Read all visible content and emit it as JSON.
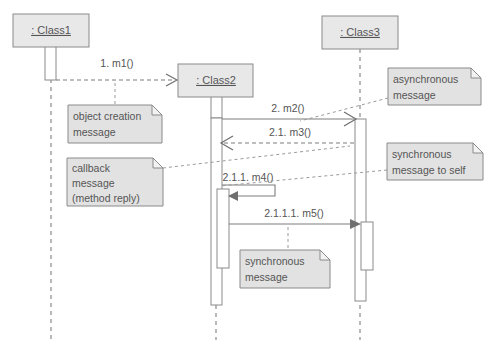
{
  "diagram": {
    "type": "uml-sequence-diagram",
    "colors": {
      "box_fill": "#e8e8e8",
      "note_fill": "#e2e2e2",
      "line": "#8a8a8a",
      "text": "#555555",
      "background": "#ffffff"
    },
    "lifelines": [
      {
        "id": "class1",
        "label": ": Class1",
        "x": 51,
        "box": {
          "x": 13,
          "y": 14,
          "w": 76,
          "h": 33
        }
      },
      {
        "id": "class2",
        "label": ": Class2",
        "x": 216,
        "box": {
          "x": 178,
          "y": 64,
          "w": 75,
          "h": 33
        }
      },
      {
        "id": "class3",
        "label": ": Class3",
        "x": 360,
        "box": {
          "x": 322,
          "y": 16,
          "w": 76,
          "h": 33
        }
      }
    ],
    "messages": [
      {
        "id": "m1",
        "label": "1. m1()",
        "kind": "object-creation",
        "line_style": "dashed",
        "arrow_style": "open",
        "from": "class1",
        "to": "class2",
        "y": 80
      },
      {
        "id": "m2",
        "label": "2. m2()",
        "kind": "asynchronous",
        "line_style": "solid",
        "arrow_style": "open",
        "from": "class2",
        "to": "class3",
        "y": 119
      },
      {
        "id": "m3",
        "label": "2.1. m3()",
        "kind": "callback-reply",
        "line_style": "dashed",
        "arrow_style": "open",
        "from": "class3",
        "to": "class2",
        "y": 143
      },
      {
        "id": "m4",
        "label": "2.1.1. m4()",
        "kind": "synchronous-to-self",
        "line_style": "solid",
        "arrow_style": "filled",
        "from": "class2",
        "to": "class2",
        "y": 186
      },
      {
        "id": "m5",
        "label": "2.1.1.1. m5()",
        "kind": "synchronous",
        "line_style": "solid",
        "arrow_style": "filled",
        "from": "class2",
        "to": "class3",
        "y": 224
      }
    ],
    "notes": [
      {
        "id": "note-object-creation",
        "lines": [
          "object creation",
          "message"
        ],
        "box": {
          "x": 68,
          "y": 105,
          "w": 94,
          "h": 38
        },
        "target_message": "m1"
      },
      {
        "id": "note-callback",
        "lines": [
          "callback",
          "message",
          "(method reply)"
        ],
        "box": {
          "x": 67,
          "y": 158,
          "w": 96,
          "h": 48
        },
        "target_message": "m3"
      },
      {
        "id": "note-asynchronous",
        "lines": [
          "asynchronous",
          "message"
        ],
        "box": {
          "x": 388,
          "y": 68,
          "w": 93,
          "h": 37
        },
        "target_message": "m2"
      },
      {
        "id": "note-synchronous-self",
        "lines": [
          "synchronous",
          "message to self"
        ],
        "box": {
          "x": 387,
          "y": 143,
          "w": 96,
          "h": 37
        },
        "target_message": "m4"
      },
      {
        "id": "note-synchronous",
        "lines": [
          "synchronous",
          "message"
        ],
        "box": {
          "x": 240,
          "y": 250,
          "w": 90,
          "h": 38
        },
        "target_message": "m5"
      }
    ],
    "activations": [
      {
        "id": "act-class1-head",
        "lifeline": "class1",
        "x": 45,
        "y": 40,
        "w": 11,
        "h": 40
      },
      {
        "id": "act-class2-head",
        "lifeline": "class2",
        "x": 211,
        "y": 92,
        "w": 11,
        "h": 26
      },
      {
        "id": "act-class2-main",
        "lifeline": "class2",
        "x": 211,
        "y": 118,
        "w": 11,
        "h": 187
      },
      {
        "id": "act-class2-nested",
        "lifeline": "class2",
        "x": 217,
        "y": 189,
        "w": 12,
        "h": 79
      },
      {
        "id": "act-class3-main",
        "lifeline": "class3",
        "x": 355,
        "y": 119,
        "w": 11,
        "h": 182
      },
      {
        "id": "act-class3-nested",
        "lifeline": "class3",
        "x": 361,
        "y": 222,
        "w": 12,
        "h": 48
      }
    ]
  }
}
